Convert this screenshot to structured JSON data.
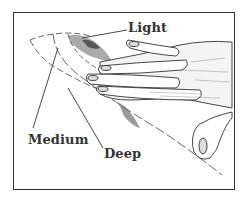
{
  "figure": {
    "labels": {
      "light": "Light",
      "medium": "Medium",
      "deep": "Deep"
    },
    "colors": {
      "ink": "#333333",
      "background": "#ffffff"
    }
  }
}
